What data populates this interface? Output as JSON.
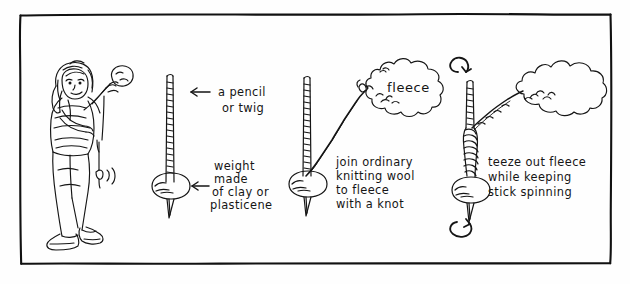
{
  "illustration": {
    "title": "Drop spindle spinning instructions",
    "style": "hand-drawn ink sketch",
    "ink_color": "#151515",
    "background_color": "#fefefe",
    "frame": {
      "name": "hand-drawn rectangular border",
      "color": "#111111"
    },
    "panels": [
      {
        "id": "panel-girl",
        "figure": "girl standing, holding fleece up in one hand with a small drop spindle hanging below",
        "labels": []
      },
      {
        "id": "panel-spindle",
        "figure": "bare spindle: a stick with a round weight near the bottom and a pointed tip",
        "labels": [
          "a pencil or twig",
          "weight made of clay or plasticene"
        ]
      },
      {
        "id": "panel-join",
        "figure": "spindle with a wool thread running up to a cloud of fleece",
        "labels": [
          "fleece",
          "join ordinary knitting wool to fleece with a knot"
        ]
      },
      {
        "id": "panel-spin",
        "figure": "spindle spinning with rotation arrows above and below, yarn twisting up to fleece",
        "labels": [
          "teeze out fleece while keeping stick spinning"
        ]
      }
    ],
    "annotations": {
      "pencil_line1": "a pencil",
      "pencil_line2": "or twig",
      "weight_line1": "weight",
      "weight_line2": "made",
      "weight_line3": "of clay or",
      "weight_line4": "plasticene",
      "join_line1": "join ordinary",
      "join_line2": "knitting wool",
      "join_line3": "to fleece",
      "join_line4": "with a knot",
      "teeze_line1": "teeze out fleece",
      "teeze_line2": "while keeping",
      "teeze_line3": "stick spinning",
      "fleece_label": "fleece"
    },
    "arrow_icons": {
      "pencil_arrow": "arrow-left-icon",
      "weight_arrow": "arrow-left-icon",
      "rotation_top": "rotate-arrow-icon",
      "rotation_bottom": "rotate-arrow-icon"
    }
  }
}
